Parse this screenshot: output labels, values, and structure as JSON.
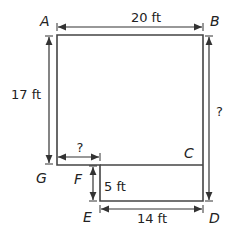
{
  "diagram": {
    "type": "composite-figure-dimensions",
    "points": {
      "A": "A",
      "B": "B",
      "C": "C",
      "D": "D",
      "E": "E",
      "F": "F",
      "G": "G"
    },
    "dimensions": {
      "top": "20 ft",
      "left": "17 ft",
      "right": "?",
      "bottom_left": "?",
      "step_height": "5 ft",
      "bottom": "14 ft"
    },
    "colors": {
      "line": "#333333",
      "text": "#222222"
    }
  }
}
